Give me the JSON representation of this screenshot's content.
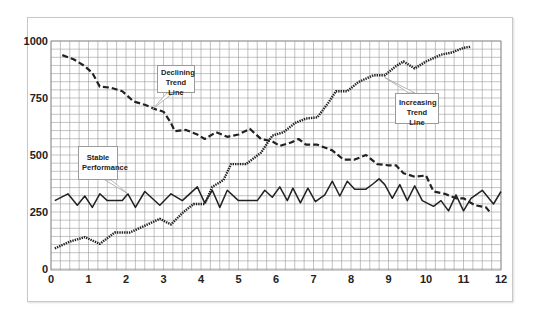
{
  "chart_data": {
    "type": "line",
    "title": "",
    "xlabel": "",
    "ylabel": "",
    "xlim": [
      0,
      12
    ],
    "ylim": [
      0,
      1000
    ],
    "grid": true,
    "x_ticks": [
      "0",
      "1",
      "2",
      "3",
      "4",
      "5",
      "6",
      "7",
      "8",
      "9",
      "10",
      "11",
      "12"
    ],
    "y_ticks": [
      "0",
      "250",
      "500",
      "750",
      "1000"
    ],
    "legend": null,
    "series": [
      {
        "name": "Declining Trend Line",
        "style": "dashed",
        "points": [
          [
            0.3,
            938
          ],
          [
            0.6,
            920
          ],
          [
            0.9,
            890
          ],
          [
            1.1,
            860
          ],
          [
            1.3,
            800
          ],
          [
            1.6,
            795
          ],
          [
            1.9,
            780
          ],
          [
            2.2,
            735
          ],
          [
            2.5,
            720
          ],
          [
            2.8,
            700
          ],
          [
            3.0,
            690
          ],
          [
            3.2,
            640
          ],
          [
            3.3,
            605
          ],
          [
            3.6,
            610
          ],
          [
            3.9,
            590
          ],
          [
            4.1,
            570
          ],
          [
            4.4,
            600
          ],
          [
            4.7,
            580
          ],
          [
            5.0,
            590
          ],
          [
            5.3,
            615
          ],
          [
            5.6,
            570
          ],
          [
            5.9,
            560
          ],
          [
            6.1,
            540
          ],
          [
            6.4,
            555
          ],
          [
            6.6,
            570
          ],
          [
            6.8,
            545
          ],
          [
            7.1,
            545
          ],
          [
            7.5,
            520
          ],
          [
            7.8,
            480
          ],
          [
            8.1,
            480
          ],
          [
            8.4,
            500
          ],
          [
            8.7,
            460
          ],
          [
            9.0,
            455
          ],
          [
            9.2,
            455
          ],
          [
            9.4,
            420
          ],
          [
            9.7,
            405
          ],
          [
            10.0,
            410
          ],
          [
            10.2,
            340
          ],
          [
            10.5,
            330
          ],
          [
            10.8,
            310
          ],
          [
            11.0,
            310
          ],
          [
            11.3,
            280
          ],
          [
            11.6,
            270
          ],
          [
            11.7,
            250
          ]
        ]
      },
      {
        "name": "Stable Performance",
        "style": "solid",
        "points": [
          [
            0.1,
            300
          ],
          [
            0.45,
            330
          ],
          [
            0.7,
            280
          ],
          [
            0.9,
            320
          ],
          [
            1.1,
            270
          ],
          [
            1.3,
            330
          ],
          [
            1.5,
            300
          ],
          [
            1.9,
            300
          ],
          [
            2.05,
            330
          ],
          [
            2.25,
            270
          ],
          [
            2.5,
            340
          ],
          [
            2.9,
            280
          ],
          [
            3.2,
            330
          ],
          [
            3.5,
            300
          ],
          [
            3.9,
            360
          ],
          [
            4.1,
            290
          ],
          [
            4.3,
            345
          ],
          [
            4.5,
            270
          ],
          [
            4.7,
            345
          ],
          [
            5.0,
            300
          ],
          [
            5.5,
            300
          ],
          [
            5.7,
            345
          ],
          [
            5.9,
            315
          ],
          [
            6.1,
            360
          ],
          [
            6.3,
            300
          ],
          [
            6.45,
            355
          ],
          [
            6.65,
            290
          ],
          [
            6.85,
            355
          ],
          [
            7.05,
            295
          ],
          [
            7.3,
            325
          ],
          [
            7.5,
            385
          ],
          [
            7.7,
            320
          ],
          [
            7.9,
            385
          ],
          [
            8.1,
            350
          ],
          [
            8.4,
            350
          ],
          [
            8.6,
            375
          ],
          [
            8.75,
            395
          ],
          [
            8.9,
            370
          ],
          [
            9.1,
            310
          ],
          [
            9.3,
            370
          ],
          [
            9.5,
            300
          ],
          [
            9.7,
            365
          ],
          [
            9.9,
            300
          ],
          [
            10.2,
            275
          ],
          [
            10.4,
            300
          ],
          [
            10.6,
            255
          ],
          [
            10.8,
            325
          ],
          [
            11.0,
            255
          ],
          [
            11.2,
            310
          ],
          [
            11.5,
            345
          ],
          [
            11.8,
            285
          ],
          [
            12.0,
            340
          ]
        ]
      },
      {
        "name": "Increasing Trend Line",
        "style": "dotted",
        "points": [
          [
            0.1,
            90
          ],
          [
            0.5,
            120
          ],
          [
            0.9,
            140
          ],
          [
            1.3,
            110
          ],
          [
            1.7,
            160
          ],
          [
            2.1,
            160
          ],
          [
            2.5,
            190
          ],
          [
            2.9,
            220
          ],
          [
            3.2,
            195
          ],
          [
            3.5,
            245
          ],
          [
            3.8,
            285
          ],
          [
            4.1,
            285
          ],
          [
            4.3,
            360
          ],
          [
            4.6,
            390
          ],
          [
            4.8,
            460
          ],
          [
            5.2,
            460
          ],
          [
            5.6,
            510
          ],
          [
            5.9,
            585
          ],
          [
            6.2,
            600
          ],
          [
            6.5,
            640
          ],
          [
            6.8,
            660
          ],
          [
            7.1,
            665
          ],
          [
            7.4,
            730
          ],
          [
            7.6,
            780
          ],
          [
            7.9,
            780
          ],
          [
            8.2,
            820
          ],
          [
            8.6,
            850
          ],
          [
            8.9,
            850
          ],
          [
            9.2,
            890
          ],
          [
            9.4,
            910
          ],
          [
            9.7,
            880
          ],
          [
            10.0,
            910
          ],
          [
            10.4,
            940
          ],
          [
            10.7,
            950
          ],
          [
            11.0,
            970
          ],
          [
            11.2,
            975
          ]
        ]
      }
    ],
    "annotations": [
      {
        "text": "Declining Trend Line",
        "line1": "Declining",
        "line2": "Trend Line",
        "points_to": [
          2.7,
          700
        ]
      },
      {
        "text": "Stable Performance",
        "line1": "Stable",
        "line2": "Performance",
        "points_to": [
          2.05,
          330
        ]
      },
      {
        "text": "Increasing Trend Line",
        "line1": "Increasing",
        "line2": "Trend Line",
        "points_to": [
          8.9,
          840
        ]
      }
    ]
  },
  "colors": {
    "grid": "#9a9a9a",
    "line": "#222222",
    "frame": "#c8c8c8",
    "background": "#ffffff"
  }
}
